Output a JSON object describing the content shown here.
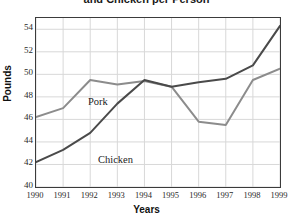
{
  "chart_data": {
    "type": "line",
    "title": "and Chicken per Person",
    "xlabel": "Years",
    "ylabel": "Pounds",
    "categories": [
      "1990",
      "1991",
      "1992",
      "1993",
      "1994",
      "1995",
      "1996",
      "1997",
      "1998",
      "1999"
    ],
    "x": [
      1990,
      1991,
      1992,
      1993,
      1994,
      1995,
      1996,
      1997,
      1998,
      1999
    ],
    "xlim": [
      1990,
      1999
    ],
    "ylim": [
      40,
      55
    ],
    "yticks": [
      40,
      42,
      44,
      46,
      48,
      50,
      52,
      54
    ],
    "grid": true,
    "legend": "inline-annotations",
    "series": [
      {
        "name": "Pork",
        "color": "#8c8c8c",
        "values": [
          46.2,
          47.0,
          49.5,
          49.1,
          49.4,
          48.9,
          45.8,
          45.5,
          49.5,
          50.5
        ],
        "annotation": "Pork"
      },
      {
        "name": "Chicken",
        "color": "#4a4a4a",
        "values": [
          42.2,
          43.3,
          44.8,
          47.4,
          49.5,
          48.9,
          49.3,
          49.6,
          50.8,
          54.3
        ],
        "annotation": "Chicken"
      }
    ],
    "annotations": [
      {
        "text": "Pork",
        "series": "Pork"
      },
      {
        "text": "Chicken",
        "series": "Chicken"
      }
    ]
  },
  "axis": {
    "y_tick_labels": [
      "54",
      "52",
      "50",
      "48",
      "46",
      "44",
      "42",
      "40"
    ],
    "x_tick_labels": [
      "1990",
      "1991",
      "1992",
      "1993",
      "1994",
      "1995",
      "1996",
      "1997",
      "1998",
      "1999"
    ],
    "y_title": "Pounds",
    "x_title": "Years"
  },
  "colors": {
    "pork_line": "#8c8c8c",
    "chicken_line": "#4a4a4a",
    "grid": "#d8d8d8",
    "frame": "#3b3b3b",
    "background": "#ffffff",
    "text": "#1a1a1a"
  }
}
